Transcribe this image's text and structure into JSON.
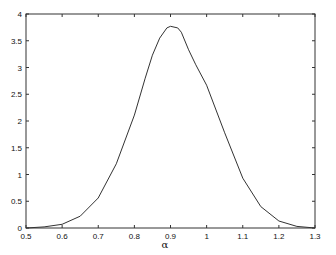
{
  "chart_data": {
    "type": "line",
    "title": "",
    "xlabel": "α",
    "ylabel": "",
    "xlim": [
      0.5,
      1.3
    ],
    "ylim": [
      0,
      4
    ],
    "grid": false,
    "legend": null,
    "x_ticks": [
      0.5,
      0.6,
      0.7,
      0.8,
      0.9,
      1.0,
      1.1,
      1.2,
      1.3
    ],
    "x_tick_labels": [
      "0.5",
      "0.6",
      "0.7",
      "0.8",
      "0.9",
      "1",
      "1.1",
      "1.2",
      "1.3"
    ],
    "y_ticks": [
      0,
      0.5,
      1,
      1.5,
      2,
      2.5,
      3,
      3.5,
      4
    ],
    "y_tick_labels": [
      "0",
      "0.5",
      "1",
      "1.5",
      "2",
      "2.5",
      "3",
      "3.5",
      "4"
    ],
    "series": [
      {
        "name": "density",
        "color": "#333333",
        "x": [
          0.5,
          0.55,
          0.6,
          0.65,
          0.7,
          0.75,
          0.8,
          0.83,
          0.85,
          0.87,
          0.89,
          0.9,
          0.92,
          0.93,
          0.95,
          0.97,
          1.0,
          1.05,
          1.1,
          1.15,
          1.2,
          1.25,
          1.3
        ],
        "values": [
          0.0,
          0.02,
          0.07,
          0.22,
          0.56,
          1.2,
          2.11,
          2.8,
          3.23,
          3.55,
          3.74,
          3.77,
          3.74,
          3.66,
          3.33,
          3.05,
          2.67,
          1.78,
          0.93,
          0.4,
          0.13,
          0.03,
          0.0
        ]
      }
    ]
  }
}
